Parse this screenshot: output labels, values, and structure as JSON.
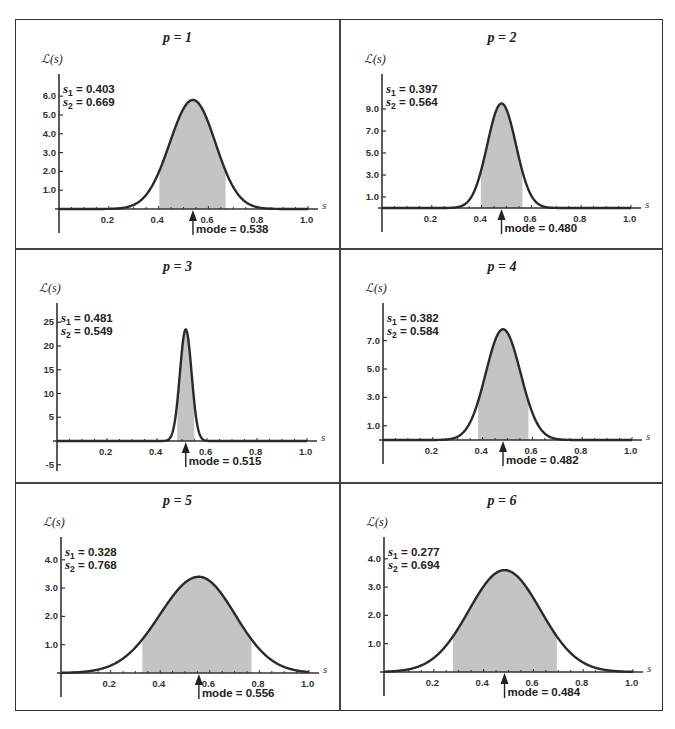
{
  "figure": {
    "ylabel_text": "ℒ(s)",
    "xlabel_text": "s",
    "colors": {
      "curve": "#2a2a2a",
      "fill": "#c4c4c4",
      "axis": "#333333",
      "frame": "#333333"
    }
  },
  "panels": [
    {
      "title": "p = 1",
      "s1_label": "s",
      "s1_sub": "1",
      "s1_value": " = 0.403",
      "s2_label": "s",
      "s2_sub": "2",
      "s2_value": " = 0.669",
      "mode_text": "mode = 0.538",
      "yticks": [
        "1.0",
        "2.0",
        "3.0",
        "4.0",
        "5.0",
        "6.0"
      ],
      "xticks": [
        "0.2",
        "0.4",
        "0.6",
        "0.8",
        "1.0"
      ]
    },
    {
      "title": "p = 2",
      "s1_label": "s",
      "s1_sub": "1",
      "s1_value": " = 0.397",
      "s2_label": "s",
      "s2_sub": "2",
      "s2_value": " = 0.564",
      "mode_text": "mode = 0.480",
      "yticks": [
        "1.0",
        "3.0",
        "5.0",
        "7.0",
        "9.0"
      ],
      "xticks": [
        "0.2",
        "0.4",
        "0.6",
        "0.8",
        "1.0"
      ]
    },
    {
      "title": "p = 3",
      "s1_label": "s",
      "s1_sub": "1",
      "s1_value": " = 0.481",
      "s2_label": "s",
      "s2_sub": "2",
      "s2_value": " = 0.549",
      "mode_text": "mode = 0.515",
      "yticks": [
        "-5",
        "5",
        "10",
        "15",
        "20",
        "25"
      ],
      "xticks": [
        "0.2",
        "0.4",
        "0.6",
        "0.8",
        "1.0"
      ]
    },
    {
      "title": "p = 4",
      "s1_label": "s",
      "s1_sub": "1",
      "s1_value": " = 0.382",
      "s2_label": "s",
      "s2_sub": "2",
      "s2_value": " = 0.584",
      "mode_text": "mode = 0.482",
      "yticks": [
        "1.0",
        "3.0",
        "5.0",
        "7.0"
      ],
      "xticks": [
        "0.2",
        "0.4",
        "0.6",
        "0.8",
        "1.0"
      ]
    },
    {
      "title": "p = 5",
      "s1_label": "s",
      "s1_sub": "1",
      "s1_value": " = 0.328",
      "s2_label": "s",
      "s2_sub": "2",
      "s2_value": " = 0.768",
      "mode_text": "mode = 0.556",
      "yticks": [
        "1.0",
        "2.0",
        "3.0",
        "4.0"
      ],
      "xticks": [
        "0.2",
        "0.4",
        "0.6",
        "0.8",
        "1.0"
      ]
    },
    {
      "title": "p = 6",
      "s1_label": "s",
      "s1_sub": "1",
      "s1_value": " = 0.277",
      "s2_label": "s",
      "s2_sub": "2",
      "s2_value": " = 0.694",
      "mode_text": "mode = 0.484",
      "yticks": [
        "1.0",
        "2.0",
        "3.0",
        "4.0"
      ],
      "xticks": [
        "0.2",
        "0.4",
        "0.6",
        "0.8",
        "1.0"
      ]
    }
  ],
  "chart_data": [
    {
      "type": "area",
      "title": "p = 1",
      "xlabel": "s",
      "ylabel": "ℒ(s)",
      "xlim": [
        0,
        1.0
      ],
      "ylim": [
        0,
        6.5
      ],
      "xticks": [
        0.2,
        0.4,
        0.6,
        0.8,
        1.0
      ],
      "yticks": [
        1.0,
        2.0,
        3.0,
        4.0,
        5.0,
        6.0
      ],
      "mode": 0.538,
      "peak": 5.8,
      "s1": 0.403,
      "s2": 0.669,
      "shaded_interval": [
        0.403,
        0.669
      ],
      "annotations": [
        "s1 = 0.403",
        "s2 = 0.669",
        "mode = 0.538"
      ],
      "grid": false
    },
    {
      "type": "area",
      "title": "p = 2",
      "xlabel": "s",
      "ylabel": "ℒ(s)",
      "xlim": [
        0,
        1.0
      ],
      "ylim": [
        0,
        11
      ],
      "xticks": [
        0.2,
        0.4,
        0.6,
        0.8,
        1.0
      ],
      "yticks": [
        1.0,
        3.0,
        5.0,
        7.0,
        9.0
      ],
      "mode": 0.48,
      "peak": 9.5,
      "s1": 0.397,
      "s2": 0.564,
      "shaded_interval": [
        0.397,
        0.564
      ],
      "annotations": [
        "s1 = 0.397",
        "s2 = 0.564",
        "mode = 0.480"
      ],
      "grid": false
    },
    {
      "type": "area",
      "title": "p = 3",
      "xlabel": "s",
      "ylabel": "ℒ(s)",
      "xlim": [
        0,
        1.0
      ],
      "ylim": [
        -6,
        28
      ],
      "xticks": [
        0.2,
        0.4,
        0.6,
        0.8,
        1.0
      ],
      "yticks": [
        -5,
        5,
        10,
        15,
        20,
        25
      ],
      "mode": 0.515,
      "peak": 23.5,
      "s1": 0.481,
      "s2": 0.549,
      "shaded_interval": [
        0.481,
        0.549
      ],
      "annotations": [
        "s1 = 0.481",
        "s2 = 0.549",
        "mode = 0.515"
      ],
      "grid": false
    },
    {
      "type": "area",
      "title": "p = 4",
      "xlabel": "s",
      "ylabel": "ℒ(s)",
      "xlim": [
        0,
        1.0
      ],
      "ylim": [
        0,
        9
      ],
      "xticks": [
        0.2,
        0.4,
        0.6,
        0.8,
        1.0
      ],
      "yticks": [
        1.0,
        3.0,
        5.0,
        7.0
      ],
      "mode": 0.482,
      "peak": 7.8,
      "s1": 0.382,
      "s2": 0.584,
      "shaded_interval": [
        0.382,
        0.584
      ],
      "annotations": [
        "s1 = 0.382",
        "s2 = 0.584",
        "mode = 0.482"
      ],
      "grid": false
    },
    {
      "type": "area",
      "title": "p = 5",
      "xlabel": "s",
      "ylabel": "ℒ(s)",
      "xlim": [
        0,
        1.0
      ],
      "ylim": [
        0,
        4.6
      ],
      "xticks": [
        0.2,
        0.4,
        0.6,
        0.8,
        1.0
      ],
      "yticks": [
        1.0,
        2.0,
        3.0,
        4.0
      ],
      "mode": 0.556,
      "peak": 3.4,
      "s1": 0.328,
      "s2": 0.768,
      "shaded_interval": [
        0.328,
        0.768
      ],
      "annotations": [
        "s1 = 0.328",
        "s2 = 0.768",
        "mode = 0.556"
      ],
      "grid": false
    },
    {
      "type": "area",
      "title": "p = 6",
      "xlabel": "s",
      "ylabel": "ℒ(s)",
      "xlim": [
        0,
        1.0
      ],
      "ylim": [
        0,
        4.6
      ],
      "xticks": [
        0.2,
        0.4,
        0.6,
        0.8,
        1.0
      ],
      "yticks": [
        1.0,
        2.0,
        3.0,
        4.0
      ],
      "mode": 0.484,
      "peak": 3.6,
      "s1": 0.277,
      "s2": 0.694,
      "shaded_interval": [
        0.277,
        0.694
      ],
      "annotations": [
        "s1 = 0.277",
        "s2 = 0.694",
        "mode = 0.484"
      ],
      "grid": false
    }
  ]
}
